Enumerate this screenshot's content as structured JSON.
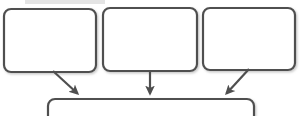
{
  "canvas": {
    "width": 301,
    "height": 116,
    "background_color": "#ffffff"
  },
  "style": {
    "stroke_color": "#4f4f4f",
    "stroke_color_light": "#6b6b6b",
    "node_fill": "#ffffff",
    "stroke_width": 2.2,
    "corner_radius": 7,
    "shadow_color": "#bdbdbd",
    "top_band_color": "#e4e4e4"
  },
  "diagram": {
    "type": "flowchart",
    "orientation": "top-down-converging",
    "top_band": {
      "label": "",
      "x": 25,
      "y": 0,
      "width": 80,
      "height": 4,
      "cropped": "top"
    },
    "nodes": [
      {
        "id": "node-1",
        "label": "",
        "x": 4,
        "y": 9,
        "width": 92,
        "height": 63,
        "cropped": "none"
      },
      {
        "id": "node-2",
        "label": "",
        "x": 103,
        "y": 8,
        "width": 94,
        "height": 63,
        "cropped": "none"
      },
      {
        "id": "node-3",
        "label": "",
        "x": 203,
        "y": 8,
        "width": 92,
        "height": 62,
        "cropped": "none"
      },
      {
        "id": "node-4",
        "label": "",
        "x": 48,
        "y": 99,
        "width": 206,
        "height": 30,
        "cropped": "bottom"
      }
    ],
    "connectors": [
      {
        "id": "arrow-1",
        "from": "node-1",
        "to": "node-4",
        "label": "",
        "direction": "down-right",
        "x1": 53,
        "y1": 71,
        "x2": 79,
        "y2": 95
      },
      {
        "id": "arrow-2",
        "from": "node-2",
        "to": "node-4",
        "label": "",
        "direction": "down",
        "x1": 150,
        "y1": 71,
        "x2": 150,
        "y2": 95
      },
      {
        "id": "arrow-3",
        "from": "node-3",
        "to": "node-4",
        "label": "",
        "direction": "down-left",
        "x1": 249,
        "y1": 69,
        "x2": 225,
        "y2": 95
      }
    ]
  }
}
